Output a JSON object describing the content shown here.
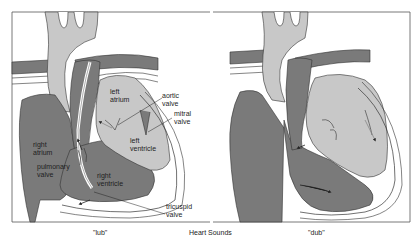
{
  "figure": {
    "title": "Heart Sounds",
    "colors": {
      "deoxygenated": "#7a7a7a",
      "oxygenated": "#c8c8c8",
      "wall": "#ffffff",
      "outline": "#333333",
      "frame": "#555555"
    }
  },
  "panels": [
    {
      "caption": "\"lub\"",
      "labels": {
        "left_atrium": "left\natrium",
        "aortic_valve": "aortic\nvalve",
        "mitral_valve": "mitral\nvalve",
        "left_ventricle": "left\nventricle",
        "right_atrium": "right\natrium",
        "pulmonary_valve": "pulmonary\nvalve",
        "right_ventricle": "right\nventricle",
        "tricuspid_valve": "tricuspid\nvalve"
      }
    },
    {
      "caption": "\"dub\""
    }
  ]
}
